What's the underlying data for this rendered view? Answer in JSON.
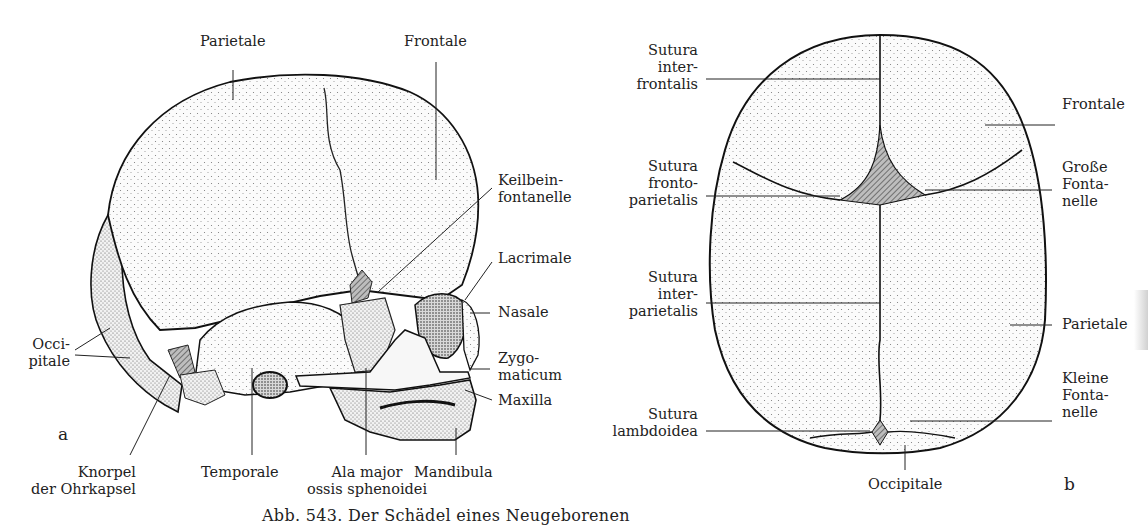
{
  "figure": {
    "caption": "Abb. 543. Der Schädel eines Neugeborenen",
    "panel_a": {
      "letter": "a",
      "view": "lateral",
      "labels": {
        "parietale": "Parietale",
        "frontale": "Frontale",
        "keilbein": [
          "Keilbein-",
          "fontanelle"
        ],
        "lacrimale": "Lacrimale",
        "nasale": "Nasale",
        "zygomaticum": [
          "Zygo-",
          "maticum"
        ],
        "maxilla": "Maxilla",
        "occipitale": [
          "Occi-",
          "pitale"
        ],
        "knorpel": [
          "Knorpel",
          "der Ohrkapsel"
        ],
        "temporale": "Temporale",
        "ala_major": [
          "Ala major",
          "ossis sphenoidei"
        ],
        "mandibula": "Mandibula"
      }
    },
    "panel_b": {
      "letter": "b",
      "view": "superior",
      "labels": {
        "sutura_interfrontalis": [
          "Sutura",
          "inter-",
          "frontalis"
        ],
        "sutura_frontoparietalis": [
          "Sutura",
          "fronto-",
          "parietalis"
        ],
        "sutura_interparietalis": [
          "Sutura",
          "inter-",
          "parietalis"
        ],
        "sutura_lambdoidea": [
          "Sutura",
          "lambdoidea"
        ],
        "frontale": "Frontale",
        "grosse_fontanelle": [
          "Große",
          "Fonta-",
          "nelle"
        ],
        "parietale": "Parietale",
        "kleine_fontanelle": [
          "Kleine",
          "Fonta-",
          "nelle"
        ],
        "occipitale": "Occipitale"
      }
    }
  }
}
